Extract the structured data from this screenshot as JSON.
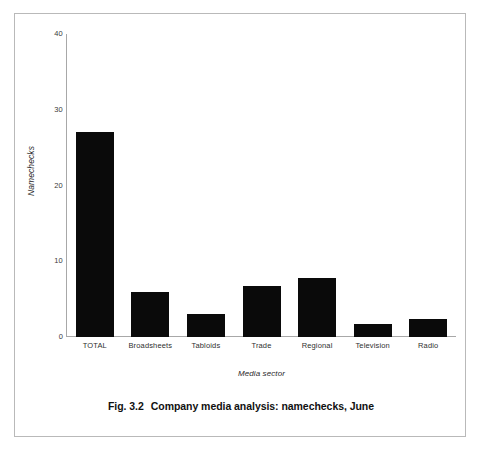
{
  "figure": {
    "caption_number": "Fig. 3.2",
    "caption_text": "Company media analysis: namechecks, June",
    "frame_color": "#b9b9b9",
    "background": "#ffffff"
  },
  "chart_data": {
    "type": "bar",
    "title": "Company media analysis: namechecks, June",
    "subtitle": "",
    "xlabel": "Media sector",
    "ylabel": "Namechecks",
    "categories": [
      "TOTAL",
      "Broadsheets",
      "Tabloids",
      "Trade",
      "Regional",
      "Television",
      "Radio"
    ],
    "values": [
      27,
      6,
      3,
      6.8,
      7.8,
      1.7,
      2.4
    ],
    "ylim": [
      0,
      40
    ],
    "yticks": [
      0,
      10,
      20,
      30,
      40
    ],
    "ytick_labels": [
      "0",
      "10",
      "20",
      "30",
      "40"
    ],
    "grid": false,
    "legend": false,
    "bar_color": "#0a0a0a",
    "axis_color": "#a8a8a8"
  }
}
